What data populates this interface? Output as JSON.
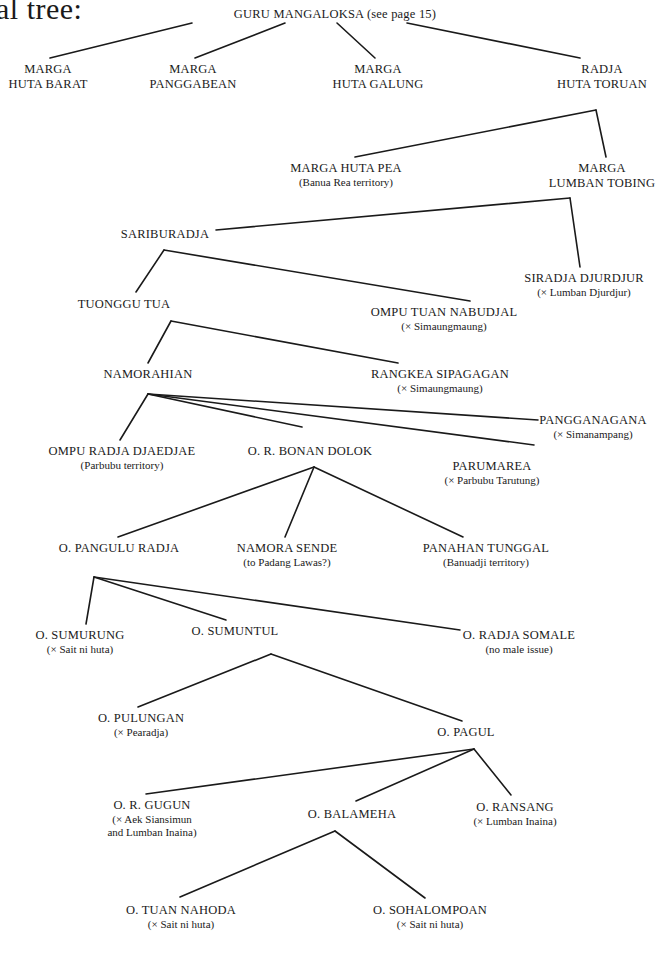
{
  "heading": "al tree:",
  "nodes": [
    {
      "id": "guru-mangaloksa",
      "name": "GURU MANGALOKSA (see page 15)",
      "note": "",
      "x": 335,
      "y": 7
    },
    {
      "id": "marga-huta-barat",
      "name": "MARGA",
      "note": "HUTA BARAT",
      "x": 48,
      "y": 62,
      "two_line_name": true
    },
    {
      "id": "marga-panggabean",
      "name": "MARGA",
      "note": "PANGGABEAN",
      "x": 193,
      "y": 62,
      "two_line_name": true
    },
    {
      "id": "marga-huta-galung",
      "name": "MARGA",
      "note": "HUTA GALUNG",
      "x": 378,
      "y": 62,
      "two_line_name": true
    },
    {
      "id": "radja-huta-toruan",
      "name": "RADJA",
      "note": "HUTA TORUAN",
      "x": 602,
      "y": 62,
      "two_line_name": true
    },
    {
      "id": "marga-huta-pea",
      "name": "MARGA HUTA PEA",
      "note": "(Banua Rea territory)",
      "x": 346,
      "y": 161
    },
    {
      "id": "marga-lumban-tobing",
      "name": "MARGA",
      "note": "LUMBAN TOBING",
      "x": 602,
      "y": 161,
      "two_line_name": true
    },
    {
      "id": "sariburadja",
      "name": "SARIBURADJA",
      "note": "",
      "x": 165,
      "y": 227
    },
    {
      "id": "siradja-djurdjur",
      "name": "SIRADJA DJURDJUR",
      "note": "(× Lumban Djurdjur)",
      "x": 584,
      "y": 271
    },
    {
      "id": "tuonggu-tua",
      "name": "TUONGGU TUA",
      "note": "",
      "x": 124,
      "y": 297
    },
    {
      "id": "ompu-tuan-nabudjal",
      "name": "OMPU TUAN NABUDJAL",
      "note": "(× Simaungmaung)",
      "x": 444,
      "y": 305
    },
    {
      "id": "namorahian",
      "name": "NAMORAHIAN",
      "note": "",
      "x": 148,
      "y": 367
    },
    {
      "id": "rangkea-sipagagan",
      "name": "RANGKEA SIPAGAGAN",
      "note": "(× Simaungmaung)",
      "x": 440,
      "y": 367
    },
    {
      "id": "pangganagana",
      "name": "PANGGANAGANA",
      "note": "(× Simanampang)",
      "x": 593,
      "y": 413
    },
    {
      "id": "ompu-radja-djaedjae",
      "name": "OMPU RADJA DJAEDJAE",
      "note": "(Parbubu territory)",
      "x": 122,
      "y": 444
    },
    {
      "id": "or-bonan-dolok",
      "name": "O. R. BONAN DOLOK",
      "note": "",
      "x": 310,
      "y": 444
    },
    {
      "id": "parumarea",
      "name": "PARUMAREA",
      "note": "(× Parbubu Tarutung)",
      "x": 492,
      "y": 459
    },
    {
      "id": "o-pangulu-radja",
      "name": "O. PANGULU RADJA",
      "note": "",
      "x": 119,
      "y": 541
    },
    {
      "id": "namora-sende",
      "name": "NAMORA SENDE",
      "note": "(to Padang Lawas?)",
      "x": 287,
      "y": 541
    },
    {
      "id": "panahan-tunggal",
      "name": "PANAHAN TUNGGAL",
      "note": "(Banuadji territory)",
      "x": 486,
      "y": 541
    },
    {
      "id": "o-sumurung",
      "name": "O. SUMURUNG",
      "note": "(× Sait ni huta)",
      "x": 80,
      "y": 628
    },
    {
      "id": "o-sumuntul",
      "name": "O. SUMUNTUL",
      "note": "",
      "x": 235,
      "y": 624
    },
    {
      "id": "o-radja-somale",
      "name": "O. RADJA SOMALE",
      "note": "(no male issue)",
      "x": 519,
      "y": 628
    },
    {
      "id": "o-pulungan",
      "name": "O. PULUNGAN",
      "note": "(× Pearadja)",
      "x": 141,
      "y": 711
    },
    {
      "id": "o-pagul",
      "name": "O. PAGUL",
      "note": "",
      "x": 466,
      "y": 725
    },
    {
      "id": "or-gugun",
      "name": "O. R. GUGUN",
      "note": "(× Aek Siansimun",
      "note2": "and Lumban Inaina)",
      "x": 152,
      "y": 798
    },
    {
      "id": "o-balameha",
      "name": "O. BALAMEHA",
      "note": "",
      "x": 352,
      "y": 807
    },
    {
      "id": "o-ransang",
      "name": "O. RANSANG",
      "note": "(× Lumban Inaina)",
      "x": 515,
      "y": 800
    },
    {
      "id": "o-tuan-nahoda",
      "name": "O. TUAN NAHODA",
      "note": "(× Sait ni huta)",
      "x": 181,
      "y": 903
    },
    {
      "id": "o-sohalompoan",
      "name": "O. SOHALOMPOAN",
      "note": "(× Sait ni huta)",
      "x": 430,
      "y": 903
    }
  ],
  "edges": [
    {
      "from": "guru-mangaloksa",
      "to": "marga-huta-barat",
      "x1": 192,
      "y1": 23,
      "x2": 50,
      "y2": 58
    },
    {
      "from": "guru-mangaloksa",
      "to": "marga-panggabean",
      "x1": 285,
      "y1": 23,
      "x2": 195,
      "y2": 58
    },
    {
      "from": "guru-mangaloksa",
      "to": "marga-huta-galung",
      "x1": 337,
      "y1": 23,
      "x2": 375,
      "y2": 58
    },
    {
      "from": "guru-mangaloksa",
      "to": "radja-huta-toruan",
      "x1": 407,
      "y1": 23,
      "x2": 580,
      "y2": 58
    },
    {
      "from": "radja-huta-toruan",
      "to": "marga-huta-pea",
      "x1": 596,
      "y1": 110,
      "x2": 355,
      "y2": 157
    },
    {
      "from": "radja-huta-toruan",
      "to": "marga-lumban-tobing",
      "x1": 596,
      "y1": 110,
      "x2": 606,
      "y2": 157
    },
    {
      "from": "marga-lumban-tobing",
      "to": "sariburadja",
      "x1": 570,
      "y1": 198,
      "x2": 216,
      "y2": 230
    },
    {
      "from": "marga-lumban-tobing",
      "to": "siradja-djurdjur",
      "x1": 570,
      "y1": 198,
      "x2": 580,
      "y2": 267
    },
    {
      "from": "sariburadja",
      "to": "tuonggu-tua",
      "x1": 164,
      "y1": 250,
      "x2": 136,
      "y2": 292
    },
    {
      "from": "sariburadja",
      "to": "ompu-tuan-nabudjal",
      "x1": 164,
      "y1": 250,
      "x2": 470,
      "y2": 301
    },
    {
      "from": "tuonggu-tua",
      "to": "namorahian",
      "x1": 171,
      "y1": 321,
      "x2": 148,
      "y2": 363
    },
    {
      "from": "tuonggu-tua",
      "to": "rangkea-sipagagan",
      "x1": 171,
      "y1": 321,
      "x2": 398,
      "y2": 363
    },
    {
      "from": "namorahian",
      "to": "ompu-radja-djaedjae",
      "x1": 148,
      "y1": 394,
      "x2": 120,
      "y2": 440
    },
    {
      "from": "namorahian",
      "to": "or-bonan-dolok",
      "x1": 148,
      "y1": 394,
      "x2": 302,
      "y2": 427
    },
    {
      "from": "namorahian",
      "to": "parumarea",
      "x1": 148,
      "y1": 394,
      "x2": 534,
      "y2": 445
    },
    {
      "from": "namorahian",
      "to": "pangganagana",
      "x1": 148,
      "y1": 394,
      "x2": 538,
      "y2": 420
    },
    {
      "from": "or-bonan-dolok",
      "to": "o-pangulu-radja",
      "x1": 314,
      "y1": 467,
      "x2": 118,
      "y2": 537
    },
    {
      "from": "or-bonan-dolok",
      "to": "namora-sende",
      "x1": 314,
      "y1": 467,
      "x2": 285,
      "y2": 537
    },
    {
      "from": "or-bonan-dolok",
      "to": "panahan-tunggal",
      "x1": 314,
      "y1": 467,
      "x2": 463,
      "y2": 537
    },
    {
      "from": "o-pangulu-radja",
      "to": "o-sumurung",
      "x1": 94,
      "y1": 577,
      "x2": 86,
      "y2": 624
    },
    {
      "from": "o-pangulu-radja",
      "to": "o-sumuntul",
      "x1": 94,
      "y1": 577,
      "x2": 226,
      "y2": 620
    },
    {
      "from": "o-pangulu-radja",
      "to": "o-radja-somale",
      "x1": 94,
      "y1": 577,
      "x2": 460,
      "y2": 630
    },
    {
      "from": "o-sumuntul",
      "to": "o-pulungan",
      "x1": 271,
      "y1": 654,
      "x2": 138,
      "y2": 707
    },
    {
      "from": "o-sumuntul",
      "to": "o-pagul",
      "x1": 271,
      "y1": 654,
      "x2": 462,
      "y2": 721
    },
    {
      "from": "o-pagul",
      "to": "or-gugun",
      "x1": 474,
      "y1": 749,
      "x2": 146,
      "y2": 794
    },
    {
      "from": "o-pagul",
      "to": "o-balameha",
      "x1": 474,
      "y1": 749,
      "x2": 356,
      "y2": 801
    },
    {
      "from": "o-pagul",
      "to": "o-ransang",
      "x1": 474,
      "y1": 749,
      "x2": 511,
      "y2": 795
    },
    {
      "from": "o-balameha",
      "to": "o-tuan-nahoda",
      "x1": 335,
      "y1": 831,
      "x2": 180,
      "y2": 897
    },
    {
      "from": "o-balameha",
      "to": "o-sohalompoan",
      "x1": 335,
      "y1": 831,
      "x2": 425,
      "y2": 898
    }
  ]
}
